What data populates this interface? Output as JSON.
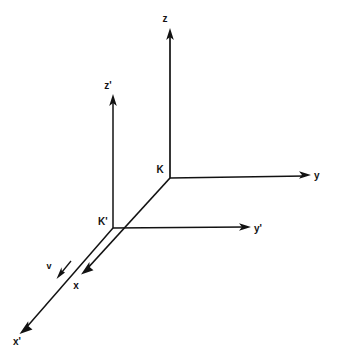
{
  "figure": {
    "kind": "physics-reference-frame-diagram",
    "background_color": "#ffffff",
    "ink_color": "#121212",
    "width": 337,
    "height": 363
  },
  "frames": [
    {
      "id": "K",
      "origin_label": "K",
      "origin_label_x": 160,
      "origin_label_y": 172,
      "origin_x": 170,
      "origin_y": 178,
      "axes": [
        {
          "name": "z-axis",
          "label": "z",
          "label_x": 165,
          "label_y": 22,
          "tip_x": 170,
          "tip_y": 29,
          "start_x": 170,
          "start_y": 178
        },
        {
          "name": "y-axis",
          "label": "y",
          "label_x": 314,
          "label_y": 178,
          "tip_x": 311,
          "tip_y": 175,
          "start_x": 170,
          "start_y": 178
        },
        {
          "name": "x-axis",
          "label": "x",
          "label_x": 76,
          "label_y": 288,
          "tip_x": 82,
          "tip_y": 273,
          "start_x": 170,
          "start_y": 178
        }
      ]
    },
    {
      "id": "K-prime",
      "origin_label": "K'",
      "origin_label_x": 98,
      "origin_label_y": 224,
      "origin_x": 113,
      "origin_y": 228,
      "axes": [
        {
          "name": "z-prime-axis",
          "label": "z'",
          "label_x": 107,
          "label_y": 88,
          "tip_x": 113,
          "tip_y": 95,
          "start_x": 113,
          "start_y": 228
        },
        {
          "name": "y-prime-axis",
          "label": "y'",
          "label_x": 254,
          "label_y": 232,
          "tip_x": 251,
          "tip_y": 228,
          "start_x": 113,
          "start_y": 228
        },
        {
          "name": "x-prime-axis",
          "label": "x'",
          "label_x": 13,
          "label_y": 344,
          "tip_x": 20,
          "tip_y": 332,
          "start_x": 113,
          "start_y": 228
        }
      ]
    }
  ],
  "velocity": {
    "label": "v",
    "label_x": 49,
    "label_y": 268,
    "arrow_start_x": 71,
    "arrow_start_y": 261,
    "arrow_tip_x": 57,
    "arrow_tip_y": 278
  }
}
